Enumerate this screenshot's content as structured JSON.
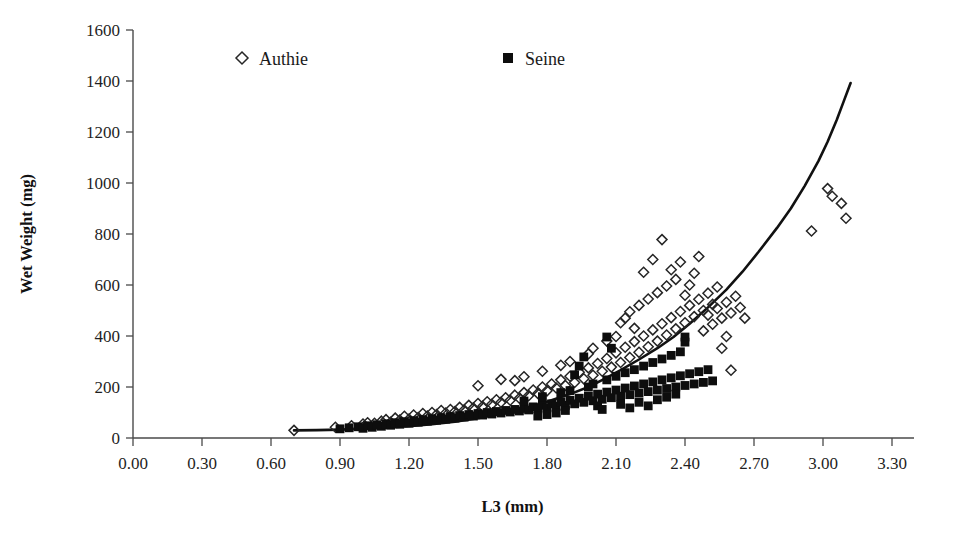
{
  "chart_data": {
    "type": "scatter",
    "title": "",
    "xlabel": "L3 (mm)",
    "ylabel": "Wet Weight (mg)",
    "xlim": [
      0.0,
      3.3
    ],
    "ylim": [
      0,
      1600
    ],
    "xticks": [
      "0.00",
      "0.30",
      "0.60",
      "0.90",
      "1.20",
      "1.50",
      "1.80",
      "2.10",
      "2.40",
      "2.70",
      "3.00",
      "3.30"
    ],
    "xtick_values": [
      0.0,
      0.3,
      0.6,
      0.9,
      1.2,
      1.5,
      1.8,
      2.1,
      2.4,
      2.7,
      3.0,
      3.3
    ],
    "yticks": [
      "0",
      "200",
      "400",
      "600",
      "800",
      "1000",
      "1200",
      "1400",
      "1600"
    ],
    "ytick_values": [
      0,
      200,
      400,
      600,
      800,
      1000,
      1200,
      1400,
      1600
    ],
    "grid": false,
    "legend_position": "top-center",
    "legend": [
      {
        "name": "Authie",
        "marker": "open-diamond",
        "color": "#262626"
      },
      {
        "name": "Seine",
        "marker": "filled-square",
        "color": "#0d0d0d"
      }
    ],
    "series": [
      {
        "name": "Authie",
        "marker": "open-diamond",
        "color": "#262626",
        "points": [
          [
            0.7,
            30
          ],
          [
            0.88,
            42
          ],
          [
            0.95,
            48
          ],
          [
            1.0,
            55
          ],
          [
            1.02,
            60
          ],
          [
            1.05,
            58
          ],
          [
            1.08,
            66
          ],
          [
            1.1,
            72
          ],
          [
            1.12,
            62
          ],
          [
            1.14,
            78
          ],
          [
            1.16,
            70
          ],
          [
            1.18,
            85
          ],
          [
            1.2,
            74
          ],
          [
            1.22,
            90
          ],
          [
            1.24,
            80
          ],
          [
            1.26,
            96
          ],
          [
            1.28,
            86
          ],
          [
            1.3,
            100
          ],
          [
            1.32,
            92
          ],
          [
            1.34,
            108
          ],
          [
            1.36,
            98
          ],
          [
            1.38,
            112
          ],
          [
            1.4,
            104
          ],
          [
            1.42,
            120
          ],
          [
            1.44,
            110
          ],
          [
            1.46,
            128
          ],
          [
            1.48,
            118
          ],
          [
            1.5,
            135
          ],
          [
            1.5,
            205
          ],
          [
            1.52,
            124
          ],
          [
            1.54,
            142
          ],
          [
            1.56,
            132
          ],
          [
            1.58,
            150
          ],
          [
            1.6,
            140
          ],
          [
            1.6,
            230
          ],
          [
            1.62,
            158
          ],
          [
            1.64,
            148
          ],
          [
            1.66,
            168
          ],
          [
            1.66,
            225
          ],
          [
            1.68,
            156
          ],
          [
            1.7,
            178
          ],
          [
            1.7,
            240
          ],
          [
            1.72,
            166
          ],
          [
            1.74,
            188
          ],
          [
            1.76,
            175
          ],
          [
            1.78,
            200
          ],
          [
            1.78,
            262
          ],
          [
            1.8,
            185
          ],
          [
            1.82,
            212
          ],
          [
            1.84,
            196
          ],
          [
            1.86,
            228
          ],
          [
            1.86,
            285
          ],
          [
            1.88,
            206
          ],
          [
            1.9,
            242
          ],
          [
            1.9,
            300
          ],
          [
            1.92,
            218
          ],
          [
            1.94,
            258
          ],
          [
            1.96,
            232
          ],
          [
            1.98,
            275
          ],
          [
            1.98,
            330
          ],
          [
            2.0,
            246
          ],
          [
            2.0,
            352
          ],
          [
            2.02,
            292
          ],
          [
            2.04,
            262
          ],
          [
            2.06,
            312
          ],
          [
            2.06,
            380
          ],
          [
            2.08,
            278
          ],
          [
            2.1,
            334
          ],
          [
            2.1,
            398
          ],
          [
            2.12,
            296
          ],
          [
            2.12,
            452
          ],
          [
            2.14,
            356
          ],
          [
            2.14,
            470
          ],
          [
            2.16,
            316
          ],
          [
            2.16,
            495
          ],
          [
            2.18,
            378
          ],
          [
            2.18,
            430
          ],
          [
            2.2,
            336
          ],
          [
            2.2,
            520
          ],
          [
            2.22,
            400
          ],
          [
            2.22,
            650
          ],
          [
            2.24,
            358
          ],
          [
            2.24,
            545
          ],
          [
            2.26,
            424
          ],
          [
            2.26,
            700
          ],
          [
            2.28,
            380
          ],
          [
            2.28,
            570
          ],
          [
            2.3,
            448
          ],
          [
            2.3,
            778
          ],
          [
            2.32,
            404
          ],
          [
            2.32,
            596
          ],
          [
            2.34,
            472
          ],
          [
            2.34,
            660
          ],
          [
            2.36,
            428
          ],
          [
            2.36,
            622
          ],
          [
            2.38,
            496
          ],
          [
            2.38,
            690
          ],
          [
            2.4,
            452
          ],
          [
            2.4,
            560
          ],
          [
            2.42,
            520
          ],
          [
            2.42,
            600
          ],
          [
            2.44,
            476
          ],
          [
            2.44,
            646
          ],
          [
            2.46,
            544
          ],
          [
            2.46,
            712
          ],
          [
            2.48,
            500
          ],
          [
            2.48,
            420
          ],
          [
            2.5,
            568
          ],
          [
            2.5,
            482
          ],
          [
            2.52,
            524
          ],
          [
            2.52,
            446
          ],
          [
            2.54,
            592
          ],
          [
            2.54,
            508
          ],
          [
            2.56,
            470
          ],
          [
            2.56,
            352
          ],
          [
            2.58,
            532
          ],
          [
            2.58,
            398
          ],
          [
            2.6,
            490
          ],
          [
            2.6,
            266
          ],
          [
            2.62,
            556
          ],
          [
            2.64,
            512
          ],
          [
            2.66,
            470
          ],
          [
            2.95,
            812
          ],
          [
            3.02,
            978
          ],
          [
            3.04,
            948
          ],
          [
            3.08,
            920
          ],
          [
            3.1,
            862
          ]
        ]
      },
      {
        "name": "Seine",
        "marker": "filled-square",
        "color": "#0d0d0d",
        "points": [
          [
            0.9,
            36
          ],
          [
            0.94,
            40
          ],
          [
            0.98,
            44
          ],
          [
            1.0,
            38
          ],
          [
            1.02,
            48
          ],
          [
            1.04,
            42
          ],
          [
            1.06,
            52
          ],
          [
            1.08,
            46
          ],
          [
            1.1,
            56
          ],
          [
            1.12,
            50
          ],
          [
            1.14,
            60
          ],
          [
            1.16,
            54
          ],
          [
            1.18,
            64
          ],
          [
            1.2,
            58
          ],
          [
            1.22,
            68
          ],
          [
            1.24,
            62
          ],
          [
            1.26,
            72
          ],
          [
            1.28,
            66
          ],
          [
            1.3,
            76
          ],
          [
            1.32,
            70
          ],
          [
            1.34,
            80
          ],
          [
            1.36,
            74
          ],
          [
            1.38,
            84
          ],
          [
            1.4,
            78
          ],
          [
            1.42,
            88
          ],
          [
            1.44,
            82
          ],
          [
            1.46,
            92
          ],
          [
            1.48,
            86
          ],
          [
            1.5,
            96
          ],
          [
            1.52,
            90
          ],
          [
            1.54,
            100
          ],
          [
            1.56,
            94
          ],
          [
            1.58,
            104
          ],
          [
            1.6,
            98
          ],
          [
            1.62,
            108
          ],
          [
            1.64,
            102
          ],
          [
            1.66,
            112
          ],
          [
            1.68,
            106
          ],
          [
            1.7,
            116
          ],
          [
            1.7,
            145
          ],
          [
            1.72,
            110
          ],
          [
            1.74,
            122
          ],
          [
            1.76,
            114
          ],
          [
            1.78,
            128
          ],
          [
            1.78,
            162
          ],
          [
            1.8,
            118
          ],
          [
            1.82,
            134
          ],
          [
            1.84,
            124
          ],
          [
            1.86,
            142
          ],
          [
            1.86,
            178
          ],
          [
            1.88,
            128
          ],
          [
            1.9,
            148
          ],
          [
            1.9,
            186
          ],
          [
            1.92,
            134
          ],
          [
            1.94,
            156
          ],
          [
            1.96,
            140
          ],
          [
            1.98,
            164
          ],
          [
            1.98,
            200
          ],
          [
            2.0,
            146
          ],
          [
            2.0,
            212
          ],
          [
            2.02,
            172
          ],
          [
            2.04,
            152
          ],
          [
            2.06,
            180
          ],
          [
            2.06,
            228
          ],
          [
            2.08,
            158
          ],
          [
            2.1,
            188
          ],
          [
            2.1,
            242
          ],
          [
            2.12,
            164
          ],
          [
            2.12,
            132
          ],
          [
            2.14,
            196
          ],
          [
            2.14,
            256
          ],
          [
            2.16,
            170
          ],
          [
            2.16,
            118
          ],
          [
            2.18,
            204
          ],
          [
            2.18,
            268
          ],
          [
            2.2,
            176
          ],
          [
            2.2,
            140
          ],
          [
            2.22,
            212
          ],
          [
            2.22,
            282
          ],
          [
            2.24,
            182
          ],
          [
            2.24,
            126
          ],
          [
            2.26,
            220
          ],
          [
            2.26,
            296
          ],
          [
            2.28,
            188
          ],
          [
            2.28,
            150
          ],
          [
            2.3,
            228
          ],
          [
            2.3,
            310
          ],
          [
            2.32,
            194
          ],
          [
            2.32,
            160
          ],
          [
            2.34,
            236
          ],
          [
            2.34,
            324
          ],
          [
            2.36,
            200
          ],
          [
            2.36,
            172
          ],
          [
            2.38,
            244
          ],
          [
            2.38,
            338
          ],
          [
            2.4,
            206
          ],
          [
            2.4,
            396
          ],
          [
            2.4,
            376
          ],
          [
            2.42,
            252
          ],
          [
            2.44,
            212
          ],
          [
            2.46,
            260
          ],
          [
            2.48,
            218
          ],
          [
            2.5,
            268
          ],
          [
            2.52,
            224
          ],
          [
            2.06,
            396
          ],
          [
            2.08,
            352
          ],
          [
            1.96,
            318
          ],
          [
            1.94,
            282
          ],
          [
            1.92,
            248
          ],
          [
            2.02,
            126
          ],
          [
            2.04,
            112
          ],
          [
            1.88,
            108
          ],
          [
            1.84,
            98
          ],
          [
            1.8,
            92
          ],
          [
            1.76,
            86
          ]
        ]
      }
    ],
    "reference_curve": {
      "name": "model-curve",
      "color": "#111111",
      "points": [
        [
          0.7,
          30
        ],
        [
          0.8,
          31
        ],
        [
          0.9,
          33
        ],
        [
          1.0,
          36
        ],
        [
          1.1,
          40
        ],
        [
          1.2,
          46
        ],
        [
          1.3,
          54
        ],
        [
          1.4,
          64
        ],
        [
          1.5,
          78
        ],
        [
          1.6,
          95
        ],
        [
          1.7,
          116
        ],
        [
          1.8,
          142
        ],
        [
          1.9,
          172
        ],
        [
          1.98,
          200
        ],
        [
          2.05,
          232
        ],
        [
          2.12,
          266
        ],
        [
          2.2,
          308
        ],
        [
          2.28,
          352
        ],
        [
          2.35,
          396
        ],
        [
          2.42,
          448
        ],
        [
          2.5,
          512
        ],
        [
          2.58,
          582
        ],
        [
          2.65,
          652
        ],
        [
          2.72,
          730
        ],
        [
          2.8,
          824
        ],
        [
          2.86,
          900
        ],
        [
          2.92,
          988
        ],
        [
          2.98,
          1086
        ],
        [
          3.02,
          1162
        ],
        [
          3.06,
          1248
        ],
        [
          3.09,
          1320
        ],
        [
          3.12,
          1392
        ]
      ]
    }
  },
  "axes": {
    "y_title": "Wet Weight (mg)",
    "x_title": "L3 (mm)"
  }
}
